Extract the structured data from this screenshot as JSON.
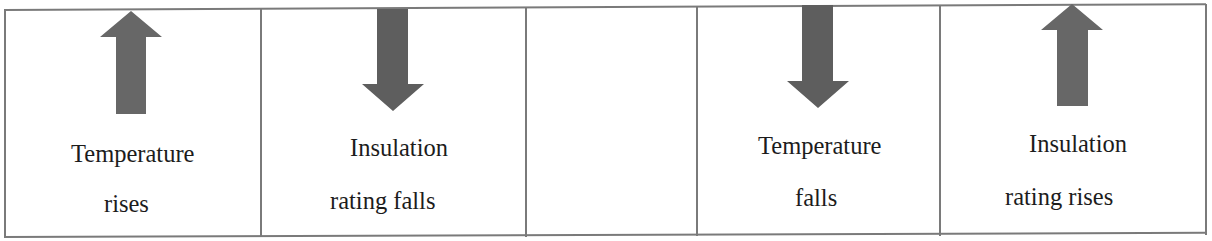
{
  "diagram": {
    "colors": {
      "arrow": "#676767",
      "border": "#7a7a7a",
      "text": "#1c1c1c",
      "background": "#ffffff"
    },
    "cells": [
      {
        "arrow": "up-arrow",
        "line1": "Temperature",
        "line2": "rises"
      },
      {
        "arrow": "down-arrow",
        "line1": "Insulation",
        "line2": "rating falls"
      },
      {
        "arrow": "none",
        "line1": "",
        "line2": ""
      },
      {
        "arrow": "down-arrow",
        "line1": "Temperature",
        "line2": "falls"
      },
      {
        "arrow": "up-arrow",
        "line1": "Insulation",
        "line2": "rating rises"
      }
    ]
  }
}
